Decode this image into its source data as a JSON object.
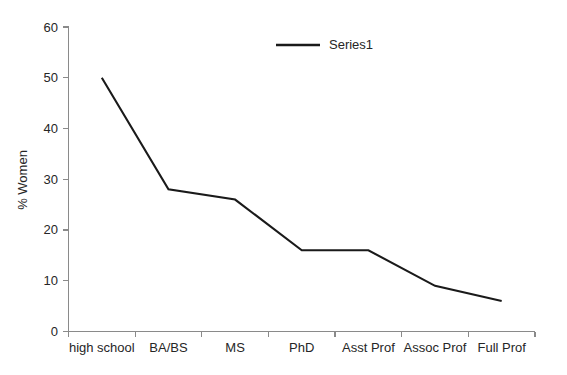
{
  "chart_data": {
    "type": "line",
    "title": "",
    "xlabel": "",
    "ylabel": "% Women",
    "categories": [
      "high school",
      "BA/BS",
      "MS",
      "PhD",
      "Asst Prof",
      "Assoc Prof",
      "Full Prof"
    ],
    "series": [
      {
        "name": "Series1",
        "values": [
          50,
          28,
          26,
          16,
          16,
          9,
          6
        ],
        "color": "#1a1a1a"
      }
    ],
    "ylim": [
      0,
      60
    ],
    "ytick_values": [
      0,
      10,
      20,
      30,
      40,
      50,
      60
    ],
    "ytick_labels": [
      "0",
      "10",
      "20",
      "30",
      "40",
      "50",
      "60"
    ],
    "grid": false,
    "legend_position": "top-center",
    "axis_color": "#8a8a8a",
    "background_color": "#ffffff"
  },
  "legend": {
    "entries": [
      {
        "label": "Series1"
      }
    ]
  }
}
